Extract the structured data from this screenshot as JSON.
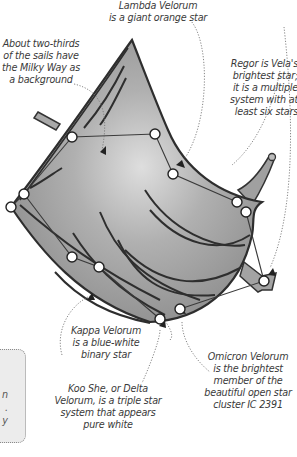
{
  "figure": {
    "colors": {
      "sail_fill": "#9c9c9c",
      "sail_highlight": "#d8d8d8",
      "outline": "#333333",
      "star_fill": "#ffffff",
      "leader_line": "#666666",
      "side_box_fill": "#ececec"
    }
  },
  "labels": {
    "lambda": "Lambda Velorum\nis a giant orange star",
    "milky_way": "About two-thirds\nof the sails have\nthe Milky Way as\na background",
    "regor": "Regor is Vela's\nbrightest star;\nit is a multiple\nsystem with at\nleast six stars",
    "kappa": "Kappa Velorum\nis a blue-white\nbinary star",
    "omicron": "Omicron Velorum\nis the brightest\nmember of the\nbeautiful open star\ncluster IC 2391",
    "delta": "Koo She, or Delta\nVelorum, is a triple star\nsystem that appears\npure white"
  },
  "side_box": {
    "text": "n\n.\ny"
  },
  "stars": [
    {
      "name": "star-1",
      "x": 72,
      "y": 137
    },
    {
      "name": "star-2",
      "x": 155,
      "y": 134
    },
    {
      "name": "star-3",
      "x": 173,
      "y": 174
    },
    {
      "name": "star-4",
      "x": 237,
      "y": 202
    },
    {
      "name": "star-5",
      "x": 246,
      "y": 212
    },
    {
      "name": "star-6",
      "x": 11,
      "y": 207
    },
    {
      "name": "star-7",
      "x": 24,
      "y": 194
    },
    {
      "name": "star-8",
      "x": 72,
      "y": 257
    },
    {
      "name": "star-9",
      "x": 99,
      "y": 267
    },
    {
      "name": "star-10",
      "x": 160,
      "y": 319
    },
    {
      "name": "star-11",
      "x": 180,
      "y": 309
    },
    {
      "name": "star-12",
      "x": 264,
      "y": 281
    }
  ]
}
